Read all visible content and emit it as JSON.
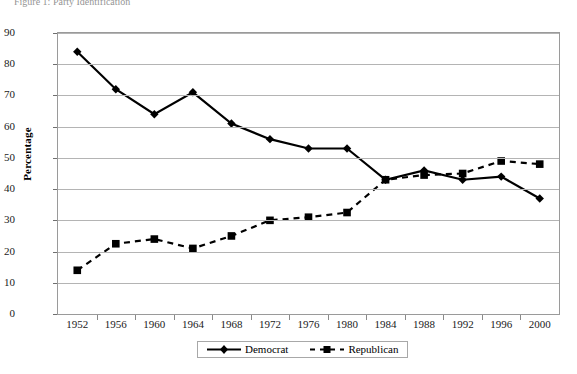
{
  "figure": {
    "caption": "Figure 1:  Party Identification"
  },
  "chart_data": {
    "type": "line",
    "title": "",
    "xlabel": "",
    "ylabel": "Percentage",
    "categories": [
      "1952",
      "1956",
      "1960",
      "1964",
      "1968",
      "1972",
      "1976",
      "1980",
      "1984",
      "1988",
      "1992",
      "1996",
      "2000"
    ],
    "ylim": [
      0,
      90
    ],
    "ytick_step": 10,
    "yticks": [
      0,
      10,
      20,
      30,
      40,
      50,
      60,
      70,
      80,
      90
    ],
    "grid": true,
    "legend_position": "bottom",
    "series": [
      {
        "name": "Democrat",
        "marker": "diamond",
        "line_style": "solid",
        "color": "#000000",
        "values": [
          84,
          72,
          64,
          71,
          61,
          56,
          53,
          53,
          43,
          46,
          43,
          44,
          37
        ]
      },
      {
        "name": "Republican",
        "marker": "square",
        "line_style": "dashed",
        "color": "#000000",
        "values": [
          14,
          22.5,
          24,
          21,
          25,
          30,
          31,
          32.5,
          43,
          44.5,
          45,
          49,
          48
        ]
      }
    ]
  },
  "legend": {
    "items": [
      {
        "label": "Democrat"
      },
      {
        "label": "Republican"
      }
    ]
  }
}
